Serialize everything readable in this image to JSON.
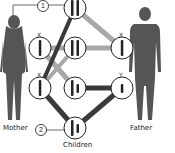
{
  "labels": {
    "mother": "Mother",
    "father": "Father",
    "children": "Children"
  },
  "markers": [
    {
      "id": "marker-1",
      "text": "1"
    },
    {
      "id": "marker-2",
      "text": "2"
    }
  ],
  "chromosome_tags": {
    "mother_x_top": "X",
    "mother_x_bottom": "X",
    "father_x": "X",
    "father_y": "Y"
  },
  "colors": {
    "silhouette": "#555555",
    "dark_line": "#3a3a3a",
    "light_line": "#a8a8a8",
    "circle_border": "#222222"
  }
}
